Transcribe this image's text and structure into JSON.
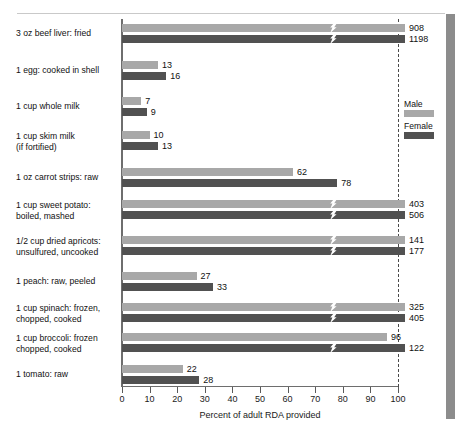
{
  "chart_data": {
    "type": "bar",
    "orientation": "horizontal",
    "title": "",
    "xlabel": "Percent of adult RDA provided",
    "ylabel": "",
    "xlim": [
      0,
      100
    ],
    "xticks": [
      0,
      10,
      20,
      30,
      40,
      50,
      60,
      70,
      80,
      90,
      100
    ],
    "xtick_labels": [
      "0",
      "10",
      "20",
      "30",
      "40",
      "50",
      "60",
      "70",
      "80",
      "90",
      "100"
    ],
    "grid": false,
    "reference_line": 100,
    "reference_line_style": "dashed",
    "note": "Bars exceeding the 100 percent axis maximum are drawn with an axis-break zig-zag mark; the printed number is the true value.",
    "legend": {
      "position": "right-inside",
      "entries": [
        {
          "name": "Male",
          "color": "#a8a8a8"
        },
        {
          "name": "Female",
          "color": "#515151"
        }
      ]
    },
    "categories": [
      "3 oz beef liver:  fried",
      "1 egg:  cooked in shell",
      "1 cup whole milk",
      "1 cup skim milk (if fortified)",
      "1 oz carrot strips:  raw",
      "1 cup sweet potato: boiled, mashed",
      "1/2 cup dried apricots: unsulfured, uncooked",
      "1 peach:  raw, peeled",
      "1 cup spinach:  frozen, chopped, cooked",
      "1 cup broccoli:  frozen chopped, cooked",
      "1 tomato:  raw"
    ],
    "series": [
      {
        "name": "Male",
        "color": "#a8a8a8",
        "values": [
          908,
          13,
          7,
          10,
          62,
          403,
          141,
          27,
          325,
          96,
          22
        ]
      },
      {
        "name": "Female",
        "color": "#515151",
        "values": [
          1198,
          16,
          9,
          13,
          78,
          506,
          177,
          33,
          405,
          122,
          28
        ]
      }
    ]
  },
  "rows": [
    {
      "label_line1": "3 oz beef liver:  fried",
      "label_line2": "",
      "male_value": "908",
      "female_value": "1198",
      "male_broken": true,
      "female_broken": true
    },
    {
      "label_line1": "1 egg:  cooked in shell",
      "label_line2": "",
      "male_value": "13",
      "female_value": "16",
      "male_broken": false,
      "female_broken": false
    },
    {
      "label_line1": "1 cup whole milk",
      "label_line2": "",
      "male_value": "7",
      "female_value": "9",
      "male_broken": false,
      "female_broken": false
    },
    {
      "label_line1": "1 cup skim milk",
      "label_line2": "(if fortified)",
      "male_value": "10",
      "female_value": "13",
      "male_broken": false,
      "female_broken": false
    },
    {
      "label_line1": "1 oz carrot strips:  raw",
      "label_line2": "",
      "male_value": "62",
      "female_value": "78",
      "male_broken": false,
      "female_broken": false
    },
    {
      "label_line1": "1 cup sweet potato:",
      "label_line2": "boiled, mashed",
      "male_value": "403",
      "female_value": "506",
      "male_broken": true,
      "female_broken": true
    },
    {
      "label_line1": "1/2 cup dried apricots:",
      "label_line2": "unsulfured, uncooked",
      "male_value": "141",
      "female_value": "177",
      "male_broken": true,
      "female_broken": true
    },
    {
      "label_line1": "1 peach:  raw, peeled",
      "label_line2": "",
      "male_value": "27",
      "female_value": "33",
      "male_broken": false,
      "female_broken": false
    },
    {
      "label_line1": "1 cup spinach:  frozen,",
      "label_line2": "chopped, cooked",
      "male_value": "325",
      "female_value": "405",
      "male_broken": true,
      "female_broken": true
    },
    {
      "label_line1": "1 cup broccoli:  frozen",
      "label_line2": "chopped, cooked",
      "male_value": "96",
      "female_value": "122",
      "male_broken": false,
      "female_broken": true
    },
    {
      "label_line1": "1 tomato:  raw",
      "label_line2": "",
      "male_value": "22",
      "female_value": "28",
      "male_broken": false,
      "female_broken": false
    }
  ],
  "axis": {
    "title": "Percent of adult RDA provided",
    "ticks": [
      "0",
      "10",
      "20",
      "30",
      "40",
      "50",
      "60",
      "70",
      "80",
      "90",
      "100"
    ]
  },
  "legend": {
    "male_label": "Male",
    "female_label": "Female"
  },
  "colors": {
    "male": "#a8a8a8",
    "female": "#515151",
    "axis": "#6e6e6e",
    "reference": "#4a4a4a",
    "text": "#111111",
    "page_edge": "#8c8c8c"
  }
}
